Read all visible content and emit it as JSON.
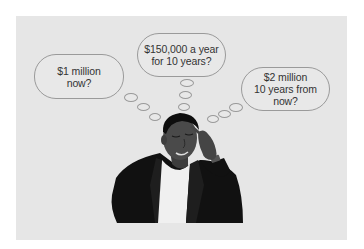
{
  "illustration": {
    "description": "Man in dark jacket thinking, finger to temple, with three thought bubbles",
    "colors": {
      "background": "#e6e6e6",
      "bubble_border": "#9a9a9a",
      "text": "#333333",
      "jacket": "#111111",
      "skin": "#4a4a4a",
      "shirt": "#f2f2f2"
    },
    "thought_bubbles": [
      {
        "id": "left",
        "text": "$1 million\nnow?"
      },
      {
        "id": "center",
        "text": "$150,000 a year\nfor 10 years?"
      },
      {
        "id": "right",
        "text": "$2 million\n10 years from\nnow?"
      }
    ]
  }
}
